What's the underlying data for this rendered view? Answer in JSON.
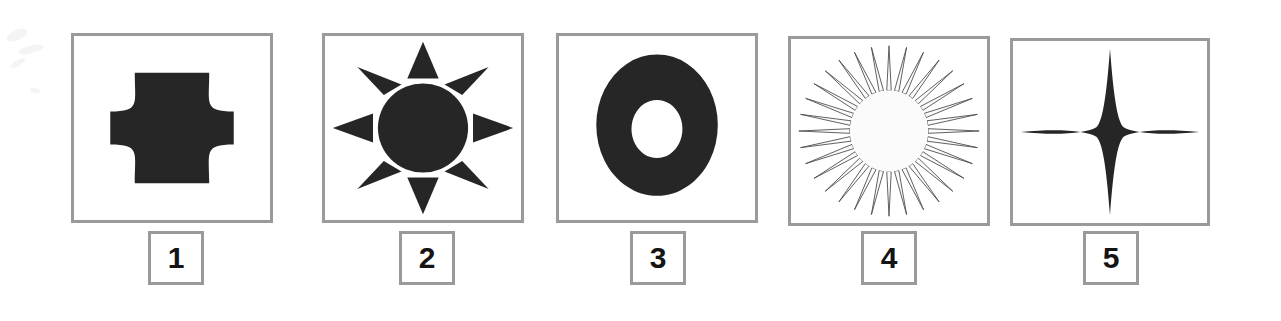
{
  "page": {
    "kind": "shape-identification-worksheet-row",
    "background_color": "#ffffff",
    "frame_border_color": "#9a9a9a",
    "shape_fill_color": "#262626",
    "label_text_color": "#141414",
    "item_count": 5
  },
  "items": [
    {
      "number": "1",
      "shape_name": "concave-square-cross",
      "shape_description": "Solid black square with four concave circular-arc sides forming a plus/cross outline",
      "filled": true,
      "frame": {
        "x": 71,
        "y": 33,
        "width": 202,
        "height": 190
      },
      "label_box": {
        "x": 148,
        "y": 231,
        "width": 56,
        "height": 54
      }
    },
    {
      "number": "2",
      "shape_name": "eight-ray-sun",
      "shape_description": "Solid black circle surrounded by eight detached triangular rays",
      "filled": true,
      "ray_count": 8,
      "frame": {
        "x": 322,
        "y": 33,
        "width": 202,
        "height": 190
      },
      "label_box": {
        "x": 399,
        "y": 231,
        "width": 56,
        "height": 54
      }
    },
    {
      "number": "3",
      "shape_name": "annulus-ring",
      "shape_description": "Solid black ring (donut) with a white circular hole in the centre",
      "filled": true,
      "frame": {
        "x": 556,
        "y": 33,
        "width": 202,
        "height": 190
      },
      "label_box": {
        "x": 630,
        "y": 231,
        "width": 56,
        "height": 54
      }
    },
    {
      "number": "4",
      "shape_name": "starburst-outline",
      "shape_description": "Unfilled many-pointed starburst drawn with thin spikes and a pale centre",
      "filled": false,
      "ray_count": 32,
      "frame": {
        "x": 788,
        "y": 36,
        "width": 202,
        "height": 190
      },
      "label_box": {
        "x": 861,
        "y": 231,
        "width": 56,
        "height": 54
      }
    },
    {
      "number": "5",
      "shape_name": "four-point-star",
      "shape_description": "Solid black four-pointed star with concave curved sides, vertical points longer",
      "filled": true,
      "point_count": 4,
      "frame": {
        "x": 1010,
        "y": 38,
        "width": 200,
        "height": 188
      },
      "label_box": {
        "x": 1083,
        "y": 231,
        "width": 56,
        "height": 54
      }
    }
  ]
}
